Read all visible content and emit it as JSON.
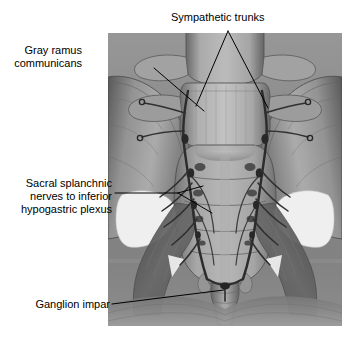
{
  "figure": {
    "kind": "anatomical-illustration",
    "view": "anterior view of sacrum, coccyx and pelvic bones",
    "rendering": "grayscale halftone medical illustration",
    "background_color": "#ffffff",
    "frame": {
      "x": 108,
      "y": 33,
      "width": 234,
      "height": 293
    },
    "palette": {
      "page_background": "#ffffff",
      "plate_mid_gray": "#8f8f8f",
      "bone_light": "#c9c9c9",
      "bone_mid": "#a2a2a2",
      "bone_shadow": "#6d6d6d",
      "deep_shadow": "#454545",
      "foramen_white": "#fdfdfd",
      "nerve_dark": "#3a3a3a",
      "label_text": "#000000",
      "leader_line": "#000000"
    }
  },
  "labels": [
    {
      "id": "sympathetic-trunks",
      "name": "Sympathetic trunks",
      "lines": [
        "Sympathetic trunks"
      ],
      "align": "left",
      "leader": "branching-v",
      "targets": [
        {
          "x": 196,
          "y": 106
        },
        {
          "x": 268,
          "y": 108
        }
      ],
      "apex": {
        "x": 228,
        "y": 31
      }
    },
    {
      "id": "gray-ramus-communicans",
      "name": "Gray ramus communicans",
      "lines": [
        "Gray ramus",
        "communicans"
      ],
      "align": "right",
      "leader": "single",
      "targets": [
        {
          "x": 204,
          "y": 111
        }
      ],
      "origin": {
        "x": 154,
        "y": 68
      }
    },
    {
      "id": "sacral-splanchnic-nerves",
      "name": "Sacral splanchnic nerves to inferior hypogastric plexus",
      "lines": [
        "Sacral splanchnic",
        "nerves to inferior",
        "hypogastric plexus"
      ],
      "align": "right",
      "leader": "forked",
      "targets": [
        {
          "x": 203,
          "y": 193
        },
        {
          "x": 210,
          "y": 213
        }
      ],
      "origin": {
        "x": 115,
        "y": 193
      }
    },
    {
      "id": "ganglion-impar",
      "name": "Ganglion impar",
      "lines": [
        "Ganglion impar"
      ],
      "align": "right",
      "leader": "single",
      "targets": [
        {
          "x": 224,
          "y": 290
        }
      ],
      "origin": {
        "x": 112,
        "y": 304
      }
    }
  ],
  "anatomy": {
    "structures": [
      "L5 vertebral body",
      "L5 transverse processes",
      "sacral promontory",
      "sacrum with transverse ridges",
      "anterior sacral foramina",
      "coccyx",
      "left ilium",
      "right ilium",
      "greater sciatic notch",
      "sacrotuberous ligament",
      "sacrospinous ligament",
      "sympathetic trunk ganglia",
      "gray rami communicantes",
      "sacral splanchnic nerves",
      "ganglion impar"
    ]
  }
}
